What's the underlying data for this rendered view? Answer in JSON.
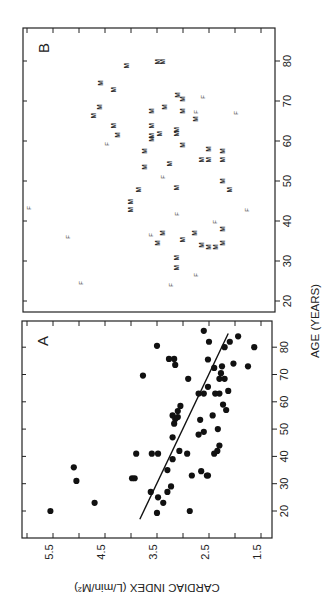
{
  "figure": {
    "orientation": "rotated-90-ccw",
    "panel_a_letter": "A",
    "panel_b_letter": "B",
    "x_axis_title": "AGE (YEARS)",
    "y_axis_title": "CARDIAC INDEX (L/min/M²)"
  },
  "chart_data": [
    {
      "type": "scatter",
      "panel": "A",
      "title": "A",
      "xlabel": "AGE (YEARS)",
      "ylabel": "CARDIAC INDEX (L/min/M²)",
      "x_ticks": [
        20,
        30,
        40,
        50,
        60,
        70,
        80
      ],
      "y_ticks": [
        5.5,
        4.5,
        3.5,
        2.5,
        1.5
      ],
      "xlim": [
        12,
        88
      ],
      "ylim": [
        1.4,
        5.9
      ],
      "grid": false,
      "marker": "filled-circle",
      "regression_line": {
        "x": [
          17,
          85
        ],
        "y": [
          3.83,
          2.13
        ]
      },
      "points": [
        {
          "age": 20,
          "ci": 5.55
        },
        {
          "age": 36,
          "ci": 5.1
        },
        {
          "age": 31,
          "ci": 5.05
        },
        {
          "age": 23,
          "ci": 4.7
        },
        {
          "age": 32,
          "ci": 3.98
        },
        {
          "age": 32,
          "ci": 3.93
        },
        {
          "age": 41,
          "ci": 3.9
        },
        {
          "age": 69.6,
          "ci": 3.77
        },
        {
          "age": 80.5,
          "ci": 3.5
        },
        {
          "age": 75.7,
          "ci": 3.27
        },
        {
          "age": 75.7,
          "ci": 3.17
        },
        {
          "age": 73.5,
          "ci": 3.15
        },
        {
          "age": 68.4,
          "ci": 2.9
        },
        {
          "age": 63,
          "ci": 2.7
        },
        {
          "age": 63,
          "ci": 2.6
        },
        {
          "age": 58.5,
          "ci": 3.05
        },
        {
          "age": 56.6,
          "ci": 3.1
        },
        {
          "age": 55,
          "ci": 3.2
        },
        {
          "age": 53.7,
          "ci": 3.15
        },
        {
          "age": 54.4,
          "ci": 3.1
        },
        {
          "age": 52,
          "ci": 3.17
        },
        {
          "age": 53.4,
          "ci": 2.67
        },
        {
          "age": 48,
          "ci": 2.7
        },
        {
          "age": 49,
          "ci": 2.6
        },
        {
          "age": 47,
          "ci": 3.2
        },
        {
          "age": 41,
          "ci": 3.6
        },
        {
          "age": 41,
          "ci": 3.48
        },
        {
          "age": 42,
          "ci": 3.07
        },
        {
          "age": 41,
          "ci": 2.92
        },
        {
          "age": 39,
          "ci": 3.2
        },
        {
          "age": 35,
          "ci": 3.3
        },
        {
          "age": 33,
          "ci": 2.83
        },
        {
          "age": 34.6,
          "ci": 2.65
        },
        {
          "age": 33,
          "ci": 2.54
        },
        {
          "age": 27,
          "ci": 3.62
        },
        {
          "age": 29,
          "ci": 3.23
        },
        {
          "age": 27,
          "ci": 3.3
        },
        {
          "age": 25,
          "ci": 3.48
        },
        {
          "age": 23,
          "ci": 3.38
        },
        {
          "age": 19.3,
          "ci": 3.5
        },
        {
          "age": 20,
          "ci": 2.87
        },
        {
          "age": 86,
          "ci": 2.6
        },
        {
          "age": 82,
          "ci": 2.5
        },
        {
          "age": 82,
          "ci": 2.1
        },
        {
          "age": 84,
          "ci": 1.94
        },
        {
          "age": 80,
          "ci": 2.2
        },
        {
          "age": 80,
          "ci": 1.63
        },
        {
          "age": 75.5,
          "ci": 2.52
        },
        {
          "age": 74,
          "ci": 2.03
        },
        {
          "age": 73,
          "ci": 1.75
        },
        {
          "age": 72.4,
          "ci": 2.4
        },
        {
          "age": 73,
          "ci": 2.25
        },
        {
          "age": 70.5,
          "ci": 2.27
        },
        {
          "age": 68.4,
          "ci": 2.3
        },
        {
          "age": 68.4,
          "ci": 2.2
        },
        {
          "age": 65.5,
          "ci": 2.52
        },
        {
          "age": 64,
          "ci": 2.13
        },
        {
          "age": 63,
          "ci": 2.38
        },
        {
          "age": 63,
          "ci": 2.3
        },
        {
          "age": 59,
          "ci": 2.23
        },
        {
          "age": 57,
          "ci": 2.17
        },
        {
          "age": 55,
          "ci": 2.43
        },
        {
          "age": 50,
          "ci": 2.33
        },
        {
          "age": 44,
          "ci": 2.3
        },
        {
          "age": 42,
          "ci": 2.34
        },
        {
          "age": 41,
          "ci": 2.4
        },
        {
          "age": 33,
          "ci": 2.52
        }
      ]
    },
    {
      "type": "scatter",
      "panel": "B",
      "title": "B",
      "xlabel": "AGE (YEARS)",
      "ylabel": "CARDIAC INDEX (L/min/M²)",
      "x_ticks": [
        20,
        30,
        40,
        50,
        60,
        70,
        80
      ],
      "xlim": [
        17,
        87
      ],
      "ylim": [
        1.4,
        6.2
      ],
      "grid": false,
      "marker": "letter (M = male, F = female)",
      "legend": [
        "M",
        "F"
      ],
      "points": [
        {
          "age": 78.8,
          "ci": 4.08,
          "sex": "M"
        },
        {
          "age": 79.8,
          "ci": 3.48,
          "sex": "M"
        },
        {
          "age": 79.8,
          "ci": 3.38,
          "sex": "M"
        },
        {
          "age": 74.5,
          "ci": 4.58,
          "sex": "M"
        },
        {
          "age": 72.8,
          "ci": 4.33,
          "sex": "M"
        },
        {
          "age": 71.5,
          "ci": 3.1,
          "sex": "M"
        },
        {
          "age": 70.5,
          "ci": 3.0,
          "sex": "M"
        },
        {
          "age": 71,
          "ci": 2.62,
          "sex": "F"
        },
        {
          "age": 68.5,
          "ci": 4.6,
          "sex": "M"
        },
        {
          "age": 66.3,
          "ci": 4.72,
          "sex": "M"
        },
        {
          "age": 67.5,
          "ci": 3.6,
          "sex": "M"
        },
        {
          "age": 68.5,
          "ci": 3.35,
          "sex": "M"
        },
        {
          "age": 67.5,
          "ci": 3.0,
          "sex": "M"
        },
        {
          "age": 67.3,
          "ci": 2.75,
          "sex": "F"
        },
        {
          "age": 65.5,
          "ci": 2.75,
          "sex": "M"
        },
        {
          "age": 67,
          "ci": 1.98,
          "sex": "F"
        },
        {
          "age": 63.8,
          "ci": 4.33,
          "sex": "M"
        },
        {
          "age": 61.5,
          "ci": 4.25,
          "sex": "M"
        },
        {
          "age": 59.3,
          "ci": 4.46,
          "sex": "F"
        },
        {
          "age": 63.8,
          "ci": 3.6,
          "sex": "M"
        },
        {
          "age": 61.3,
          "ci": 3.6,
          "sex": "M"
        },
        {
          "age": 60.5,
          "ci": 3.6,
          "sex": "M"
        },
        {
          "age": 61.8,
          "ci": 3.44,
          "sex": "M"
        },
        {
          "age": 62.8,
          "ci": 3.12,
          "sex": "M"
        },
        {
          "age": 61.8,
          "ci": 3.12,
          "sex": "M"
        },
        {
          "age": 59,
          "ci": 3.0,
          "sex": "M"
        },
        {
          "age": 57.5,
          "ci": 3.73,
          "sex": "M"
        },
        {
          "age": 58,
          "ci": 2.5,
          "sex": "M"
        },
        {
          "age": 57.5,
          "ci": 2.23,
          "sex": "M"
        },
        {
          "age": 55.3,
          "ci": 2.63,
          "sex": "M"
        },
        {
          "age": 55.3,
          "ci": 2.5,
          "sex": "M"
        },
        {
          "age": 55.3,
          "ci": 2.23,
          "sex": "M"
        },
        {
          "age": 54.3,
          "ci": 3.25,
          "sex": "M"
        },
        {
          "age": 53.5,
          "ci": 3.73,
          "sex": "M"
        },
        {
          "age": 51,
          "ci": 3.38,
          "sex": "F"
        },
        {
          "age": 50,
          "ci": 2.23,
          "sex": "M"
        },
        {
          "age": 47.8,
          "ci": 2.1,
          "sex": "M"
        },
        {
          "age": 48.3,
          "ci": 3.12,
          "sex": "M"
        },
        {
          "age": 47.8,
          "ci": 3.85,
          "sex": "M"
        },
        {
          "age": 44.8,
          "ci": 4.0,
          "sex": "M"
        },
        {
          "age": 42.8,
          "ci": 4.0,
          "sex": "M"
        },
        {
          "age": 43.3,
          "ci": 5.96,
          "sex": "F"
        },
        {
          "age": 41.8,
          "ci": 3.12,
          "sex": "F"
        },
        {
          "age": 42.8,
          "ci": 1.77,
          "sex": "F"
        },
        {
          "age": 39.8,
          "ci": 2.38,
          "sex": "F"
        },
        {
          "age": 38,
          "ci": 2.23,
          "sex": "M"
        },
        {
          "age": 37,
          "ci": 3.38,
          "sex": "M"
        },
        {
          "age": 36.5,
          "ci": 3.62,
          "sex": "F"
        },
        {
          "age": 34.5,
          "ci": 3.48,
          "sex": "M"
        },
        {
          "age": 36,
          "ci": 5.21,
          "sex": "F"
        },
        {
          "age": 35.3,
          "ci": 3.0,
          "sex": "M"
        },
        {
          "age": 37,
          "ci": 2.77,
          "sex": "M"
        },
        {
          "age": 34,
          "ci": 2.63,
          "sex": "M"
        },
        {
          "age": 33.5,
          "ci": 2.5,
          "sex": "M"
        },
        {
          "age": 33.5,
          "ci": 2.37,
          "sex": "M"
        },
        {
          "age": 34.5,
          "ci": 2.23,
          "sex": "M"
        },
        {
          "age": 30.8,
          "ci": 3.12,
          "sex": "M"
        },
        {
          "age": 28.3,
          "ci": 3.12,
          "sex": "M"
        },
        {
          "age": 26.5,
          "ci": 2.75,
          "sex": "F"
        },
        {
          "age": 24.5,
          "ci": 4.96,
          "sex": "F"
        },
        {
          "age": 24,
          "ci": 3.23,
          "sex": "F"
        }
      ]
    }
  ]
}
